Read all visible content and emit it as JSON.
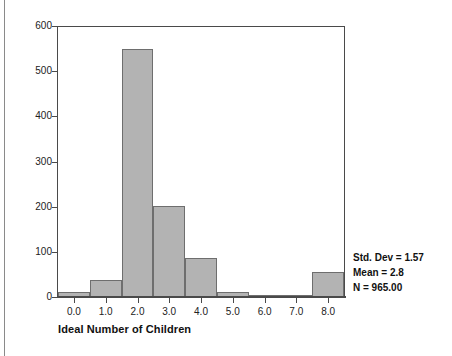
{
  "chart_data": {
    "type": "bar",
    "title": "",
    "subtitle": "",
    "xlabel": "Ideal Number of Children",
    "ylabel": "",
    "categories": [
      "0.0",
      "1.0",
      "2.0",
      "3.0",
      "4.0",
      "5.0",
      "6.0",
      "7.0",
      "8.0"
    ],
    "x": [
      0,
      1,
      2,
      3,
      4,
      5,
      6,
      7,
      8
    ],
    "values": [
      12,
      37,
      552,
      203,
      86,
      12,
      2,
      1,
      56
    ],
    "xlim": [
      -0.5,
      8.5
    ],
    "ylim": [
      0,
      600
    ],
    "ytick_labels": [
      "0",
      "100",
      "200",
      "300",
      "400",
      "500",
      "600"
    ],
    "yticks": [
      0,
      100,
      200,
      300,
      400,
      500,
      600
    ],
    "xtick_labels": [
      "0.0",
      "1.0",
      "2.0",
      "3.0",
      "4.0",
      "5.0",
      "6.0",
      "7.0",
      "8.0"
    ],
    "grid": false,
    "legend": null,
    "bar_fill_color": "#b3b3b3",
    "bar_edge_color": "#6e6e6e",
    "axis_color": "#4a4a4a",
    "annotations": [
      "Std. Dev = 1.57",
      "Mean = 2.8",
      "N = 965.00"
    ]
  },
  "statistics": {
    "std_dev_label": "Std. Dev = 1.57",
    "mean_label": "Mean = 2.8",
    "n_label": "N = 965.00"
  }
}
